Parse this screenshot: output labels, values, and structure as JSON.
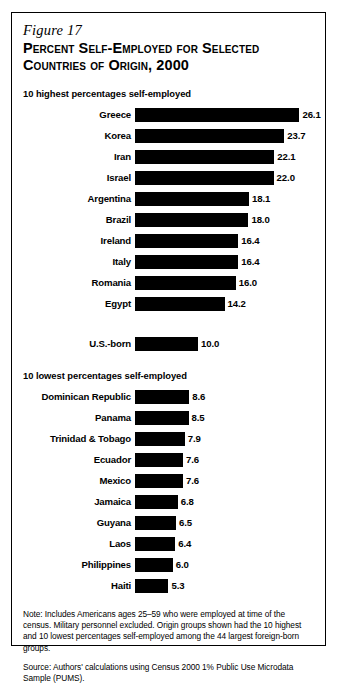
{
  "figure": {
    "number": "Figure 17",
    "title": "Percent Self-Employed for Selected Countries of Origin, 2000"
  },
  "groups": {
    "high_header": "10 highest percentages self-employed",
    "low_header": "10 lowest percentages self-employed"
  },
  "notes": {
    "note": "Note: Includes Americans ages 25–59 who were employed at time of the census. Military personnel excluded. Origin groups shown had the 10 highest and 10 lowest percentages self-employed among the 44 largest foreign-born groups.",
    "source": "Source: Authors' calculations using Census 2000 1% Public Use Microdata Sample (PUMS)."
  },
  "chart_data": {
    "type": "bar",
    "orientation": "horizontal",
    "title": "Percent Self-Employed for Selected Countries of Origin, 2000",
    "xlabel": "",
    "ylabel": "",
    "xlim": [
      0,
      26.1
    ],
    "grid": false,
    "legend": false,
    "value_format": "one-decimal percent",
    "bar_color": "#000000",
    "series": [
      {
        "name": "10 highest percentages self-employed",
        "categories": [
          "Greece",
          "Korea",
          "Iran",
          "Israel",
          "Argentina",
          "Brazil",
          "Ireland",
          "Italy",
          "Romania",
          "Egypt"
        ],
        "values": [
          26.1,
          23.7,
          22.1,
          22.0,
          18.1,
          18.0,
          16.4,
          16.4,
          16.0,
          14.2
        ]
      },
      {
        "name": "reference",
        "categories": [
          "U.S.-born"
        ],
        "values": [
          10.0
        ]
      },
      {
        "name": "10 lowest percentages self-employed",
        "categories": [
          "Dominican Republic",
          "Panama",
          "Trinidad & Tobago",
          "Ecuador",
          "Mexico",
          "Jamaica",
          "Guyana",
          "Laos",
          "Philippines",
          "Haiti"
        ],
        "values": [
          8.6,
          8.5,
          7.9,
          7.6,
          7.6,
          6.8,
          6.5,
          6.4,
          6.0,
          5.3
        ]
      }
    ]
  }
}
